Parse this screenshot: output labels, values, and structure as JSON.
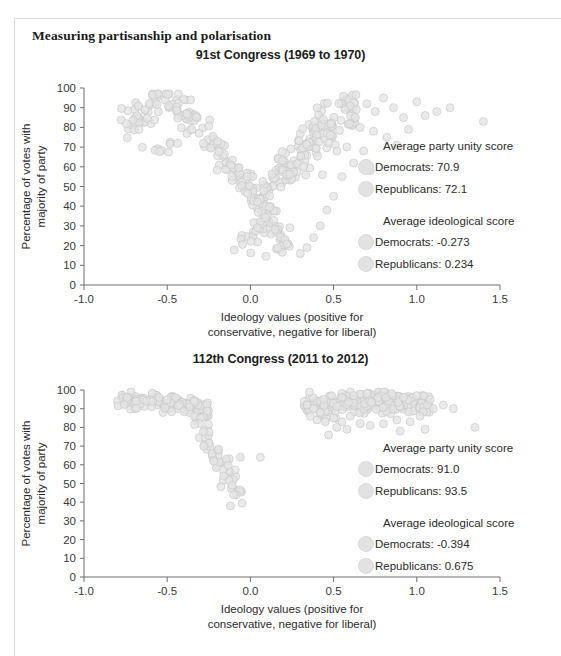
{
  "section": {
    "heading": "Measuring partisanship and polarisation"
  },
  "axes": {
    "y_title_line1": "Percentage of votes with",
    "y_title_line2": "majority of party",
    "x_title_line1": "Ideology values (positive for",
    "x_title_line2": "conservative, negative for liberal)",
    "y_ticks": [
      "0",
      "10",
      "20",
      "30",
      "40",
      "50",
      "60",
      "70",
      "80",
      "90",
      "100"
    ],
    "x_ticks": [
      "-1.0",
      "-0.5",
      "0.0",
      "0.5",
      "1.0",
      "1.5"
    ],
    "xlim": [
      -1.0,
      1.5
    ],
    "ylim": [
      0,
      100
    ]
  },
  "colors": {
    "marker_fill": "#e4e4e4",
    "marker_stroke": "#c9c9c9",
    "axis": "#6e6e6e",
    "text": "#2b2b2b",
    "frame": "#d8d8d8"
  },
  "chart_data": [
    {
      "type": "scatter",
      "title": "91st Congress (1969 to 1970)",
      "xlabel": "Ideology values (positive for conservative, negative for liberal)",
      "ylabel": "Percentage of votes with majority of party",
      "xlim": [
        -1.0,
        1.5
      ],
      "ylim": [
        0,
        100
      ],
      "xticks": [
        -1.0,
        -0.5,
        0.0,
        0.5,
        1.0,
        1.5
      ],
      "yticks": [
        0,
        10,
        20,
        30,
        40,
        50,
        60,
        70,
        80,
        90,
        100
      ],
      "grid": false,
      "legend": {
        "position": "right-middle",
        "blocks": [
          {
            "heading": "Average party unity score",
            "entries": [
              {
                "label": "Democrats: 70.9",
                "party": "Democrats",
                "value": 70.9
              },
              {
                "label": "Republicans: 72.1",
                "party": "Republicans",
                "value": 72.1
              }
            ]
          },
          {
            "heading": "Average ideological score",
            "entries": [
              {
                "label": "Democrats: -0.273",
                "party": "Democrats",
                "value": -0.273
              },
              {
                "label": "Republicans: 0.234",
                "party": "Republicans",
                "value": 0.234
              }
            ]
          }
        ]
      },
      "series": [
        {
          "name": "Democrats",
          "mean_ideology": -0.273,
          "mean_party_unity": 70.9,
          "n": 243,
          "cluster_hint": "arc from x=-0.72 high-80s rising to x=-0.45 peak ~92 then descending to x=0.25 near 20"
        },
        {
          "name": "Republicans",
          "mean_ideology": 0.234,
          "mean_party_unity": 72.1,
          "n": 192,
          "cluster_hint": "rising band from x=0.0 near 25 up to x=0.55 near 93, plus sparse outliers to x=1.4"
        }
      ]
    },
    {
      "type": "scatter",
      "title": "112th Congress (2011 to 2012)",
      "xlabel": "Ideology values (positive for conservative, negative for liberal)",
      "ylabel": "Percentage of votes with majority of party",
      "xlim": [
        -1.0,
        1.5
      ],
      "ylim": [
        0,
        100
      ],
      "xticks": [
        -1.0,
        -0.5,
        0.0,
        0.5,
        1.0,
        1.5
      ],
      "yticks": [
        0,
        10,
        20,
        30,
        40,
        50,
        60,
        70,
        80,
        90,
        100
      ],
      "grid": false,
      "legend": {
        "position": "right-middle",
        "blocks": [
          {
            "heading": "Average party unity score",
            "entries": [
              {
                "label": "Democrats: 91.0",
                "party": "Democrats",
                "value": 91.0
              },
              {
                "label": "Republicans: 93.5",
                "party": "Republicans",
                "value": 93.5
              }
            ]
          },
          {
            "heading": "Average ideological score",
            "entries": [
              {
                "label": "Democrats: -0.394",
                "party": "Democrats",
                "value": -0.394
              },
              {
                "label": "Republicans: 0.675",
                "party": "Republicans",
                "value": 0.675
              }
            ]
          }
        ]
      },
      "series": [
        {
          "name": "Democrats",
          "mean_ideology": -0.394,
          "mean_party_unity": 91.0,
          "n": 193,
          "cluster_hint": "tight band x=-0.78 to -0.25 around 93-97, tail descending to x=-0.05 near 35"
        },
        {
          "name": "Republicans",
          "mean_ideology": 0.675,
          "mean_party_unity": 93.5,
          "n": 242,
          "cluster_hint": "tight band x=0.35 to 1.05 around 90-97, few low outliers near 80 and x=1.35"
        }
      ]
    }
  ]
}
